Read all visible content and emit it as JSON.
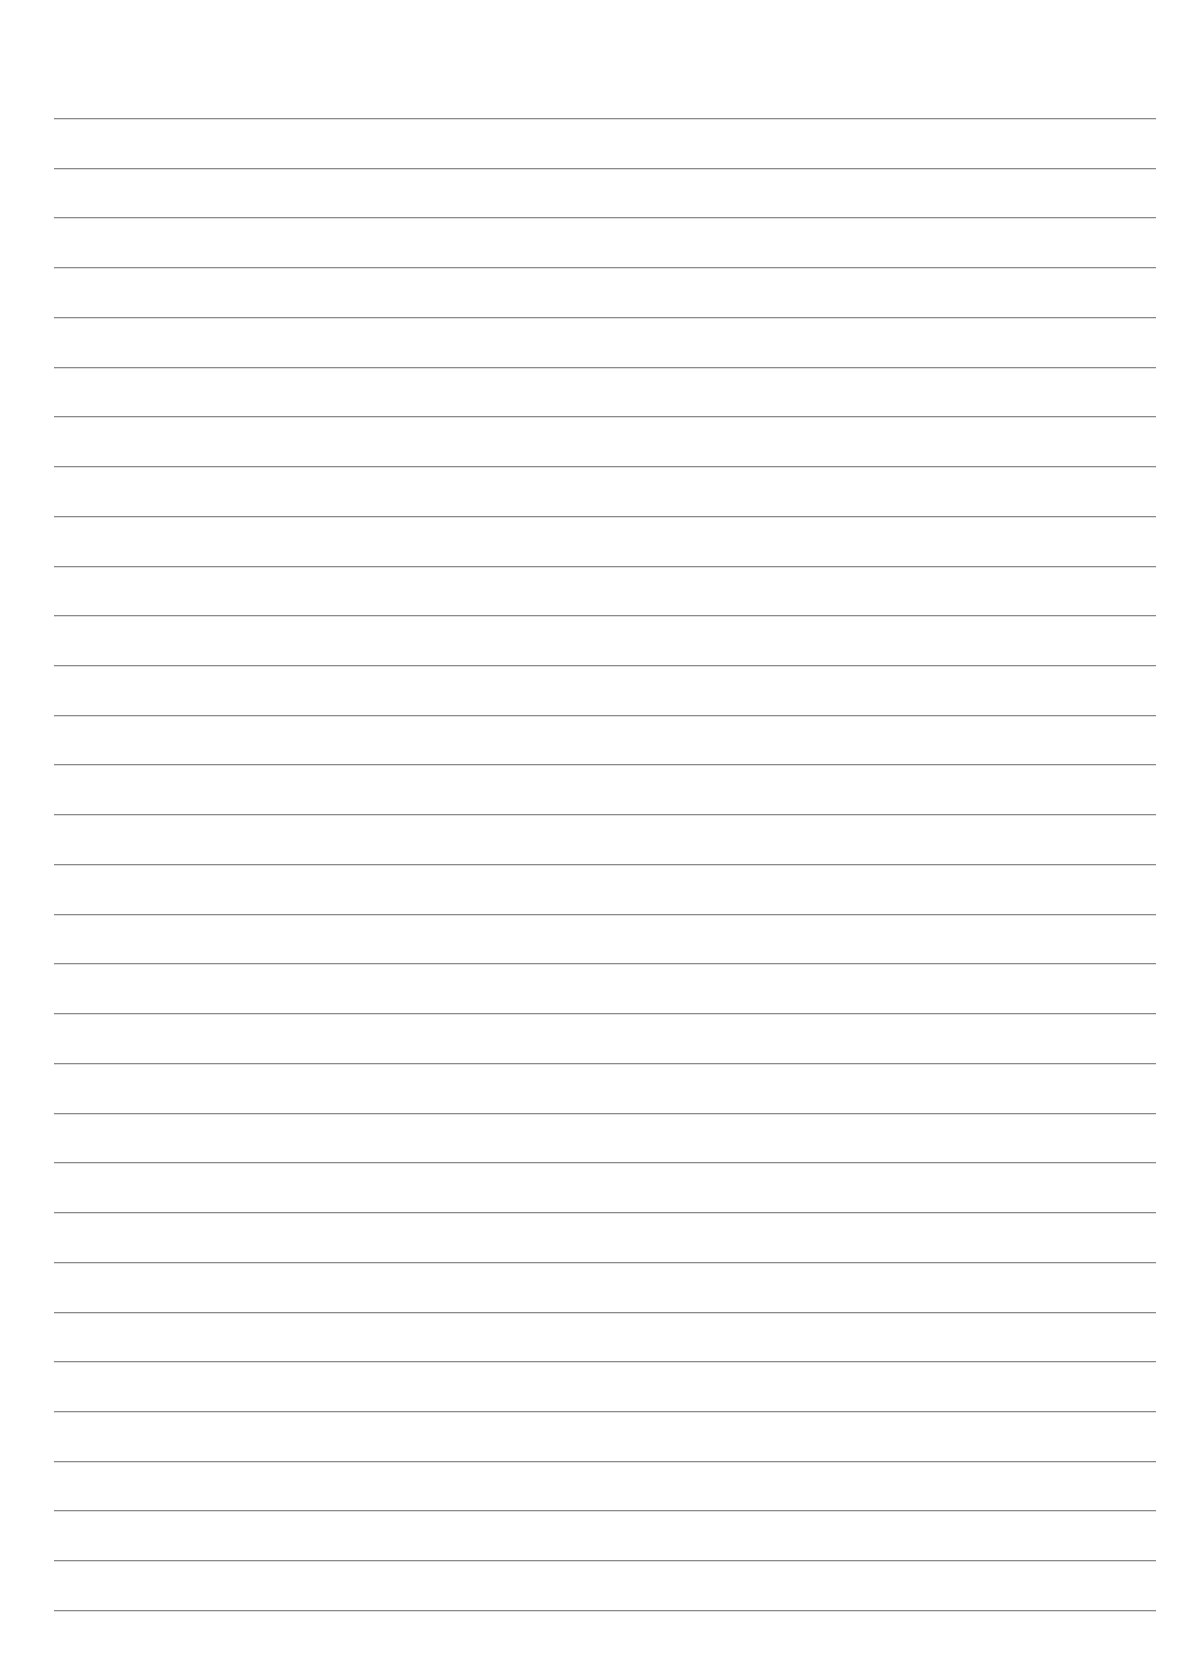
{
  "page": {
    "type": "lined-paper",
    "background_color": "#ffffff",
    "line_color": "#8a8a8a",
    "line_count": 31,
    "first_line_y": 118,
    "line_spacing": 49.73,
    "line_left": 54,
    "line_right": 1156,
    "text": ""
  }
}
